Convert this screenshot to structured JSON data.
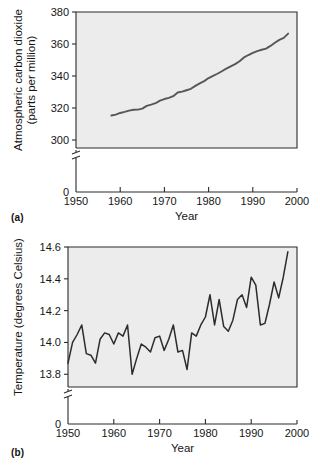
{
  "figure": {
    "panel_a_label": "(a)",
    "panel_b_label": "(b)"
  },
  "chart_data": [
    {
      "id": "co2",
      "type": "line",
      "title": "",
      "xlabel": "Year",
      "ylabel": "Atmospheric carbon dioxide (parts per million)",
      "ylabel_line1": "Atmospheric carbon dioxide",
      "ylabel_line2": "(parts per million)",
      "xlim": [
        1950,
        2000
      ],
      "ylim": [
        295,
        380
      ],
      "xticks": [
        1950,
        1960,
        1970,
        1980,
        1990,
        2000
      ],
      "xticklabels": [
        "1950",
        "1960",
        "1970",
        "1980",
        "1990",
        "2000"
      ],
      "yticks": [
        300,
        320,
        340,
        360,
        380
      ],
      "yticklabels": [
        "300",
        "320",
        "340",
        "360",
        "380"
      ],
      "y_axis_break": true,
      "y_origin_label": "0",
      "grid": false,
      "legend": "none",
      "line_color": "#575757",
      "plot_background": "#ececec",
      "x": [
        1958,
        1959,
        1960,
        1961,
        1962,
        1963,
        1964,
        1965,
        1966,
        1967,
        1968,
        1969,
        1970,
        1971,
        1972,
        1973,
        1974,
        1975,
        1976,
        1977,
        1978,
        1979,
        1980,
        1981,
        1982,
        1983,
        1984,
        1985,
        1986,
        1987,
        1988,
        1989,
        1990,
        1991,
        1992,
        1993,
        1994,
        1995,
        1996,
        1997,
        1998
      ],
      "values": [
        315.3,
        315.9,
        316.9,
        317.6,
        318.4,
        318.9,
        319.0,
        319.6,
        321.3,
        322.1,
        323.0,
        324.6,
        325.6,
        326.3,
        327.4,
        329.7,
        330.2,
        331.1,
        332.0,
        333.8,
        335.4,
        336.8,
        338.7,
        340.1,
        341.4,
        343.0,
        344.6,
        346.0,
        347.4,
        349.2,
        351.6,
        353.1,
        354.4,
        355.6,
        356.4,
        357.1,
        358.8,
        360.8,
        362.6,
        363.8,
        366.5
      ]
    },
    {
      "id": "temperature",
      "type": "line",
      "title": "",
      "xlabel": "Year",
      "ylabel": "Temperature (degrees Celsius)",
      "xlim": [
        1950,
        2000
      ],
      "ylim": [
        13.72,
        14.6
      ],
      "xticks": [
        1950,
        1960,
        1970,
        1980,
        1990,
        2000
      ],
      "xticklabels": [
        "1950",
        "1960",
        "1970",
        "1980",
        "1990",
        "2000"
      ],
      "yticks": [
        13.8,
        14.0,
        14.2,
        14.4,
        14.6
      ],
      "yticklabels": [
        "13.8",
        "14.0",
        "14.2",
        "14.4",
        "14.6"
      ],
      "y_axis_break": true,
      "y_origin_label": "0",
      "grid": false,
      "legend": "none",
      "line_color": "#2c2c2c",
      "plot_background": "#ececec",
      "x": [
        1950,
        1951,
        1952,
        1953,
        1954,
        1955,
        1956,
        1957,
        1958,
        1959,
        1960,
        1961,
        1962,
        1963,
        1964,
        1965,
        1966,
        1967,
        1968,
        1969,
        1970,
        1971,
        1972,
        1973,
        1974,
        1975,
        1976,
        1977,
        1978,
        1979,
        1980,
        1981,
        1982,
        1983,
        1984,
        1985,
        1986,
        1987,
        1988,
        1989,
        1990,
        1991,
        1992,
        1993,
        1994,
        1995,
        1996,
        1997,
        1998
      ],
      "values": [
        13.87,
        14.0,
        14.05,
        14.11,
        13.93,
        13.92,
        13.87,
        14.02,
        14.06,
        14.05,
        13.99,
        14.06,
        14.04,
        14.11,
        13.8,
        13.9,
        13.99,
        13.97,
        13.94,
        14.03,
        14.04,
        13.95,
        14.02,
        14.11,
        13.94,
        13.95,
        13.83,
        14.06,
        14.04,
        14.11,
        14.16,
        14.3,
        14.11,
        14.27,
        14.1,
        14.07,
        14.14,
        14.27,
        14.3,
        14.22,
        14.41,
        14.36,
        14.11,
        14.12,
        14.24,
        14.38,
        14.28,
        14.41,
        14.57
      ]
    }
  ]
}
